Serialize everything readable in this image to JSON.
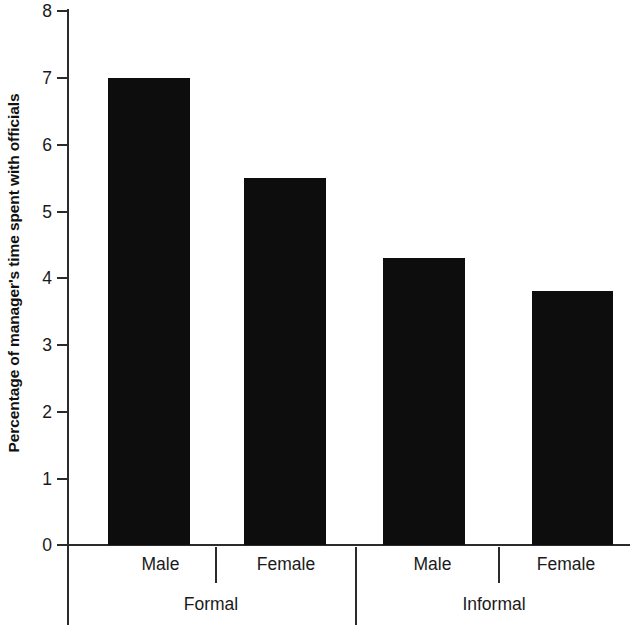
{
  "chart_data": {
    "type": "bar",
    "title": "",
    "subtitle": "",
    "xlabel": "",
    "ylabel": "Percentage of manager's time spent with officials",
    "ylim": [
      0,
      8
    ],
    "yticks": [
      0,
      1,
      2,
      3,
      4,
      5,
      6,
      7,
      8
    ],
    "ytick_labels": [
      "0",
      "1",
      "2",
      "3",
      "4",
      "5",
      "6",
      "7",
      "8"
    ],
    "grid": false,
    "legend": null,
    "bar_color": "#0d0d0d",
    "axis_color": "#2b2b2b",
    "background_color": "#ffffff",
    "categories": [
      "Male",
      "Female",
      "Male",
      "Female"
    ],
    "groups": [
      {
        "label": "Formal",
        "categories": [
          "Male",
          "Female"
        ],
        "values": [
          7.0,
          5.5
        ]
      },
      {
        "label": "Informal",
        "categories": [
          "Male",
          "Female"
        ],
        "values": [
          4.3,
          3.8
        ]
      }
    ],
    "values": [
      7.0,
      5.5,
      4.3,
      3.8
    ],
    "bars": [
      {
        "group": "Formal",
        "category": "Male",
        "value": 7.0
      },
      {
        "group": "Formal",
        "category": "Female",
        "value": 5.5
      },
      {
        "group": "Informal",
        "category": "Male",
        "value": 4.3
      },
      {
        "group": "Informal",
        "category": "Female",
        "value": 3.8
      }
    ]
  },
  "axis": {
    "y_title": "Percentage of manager's time spent with officials",
    "tick_0": "0",
    "tick_1": "1",
    "tick_2": "2",
    "tick_3": "3",
    "tick_4": "4",
    "tick_5": "5",
    "tick_6": "6",
    "tick_7": "7",
    "tick_8": "8"
  },
  "categories": {
    "formal_male": "Male",
    "formal_female": "Female",
    "informal_male": "Male",
    "informal_female": "Female",
    "group_formal": "Formal",
    "group_informal": "Informal"
  }
}
